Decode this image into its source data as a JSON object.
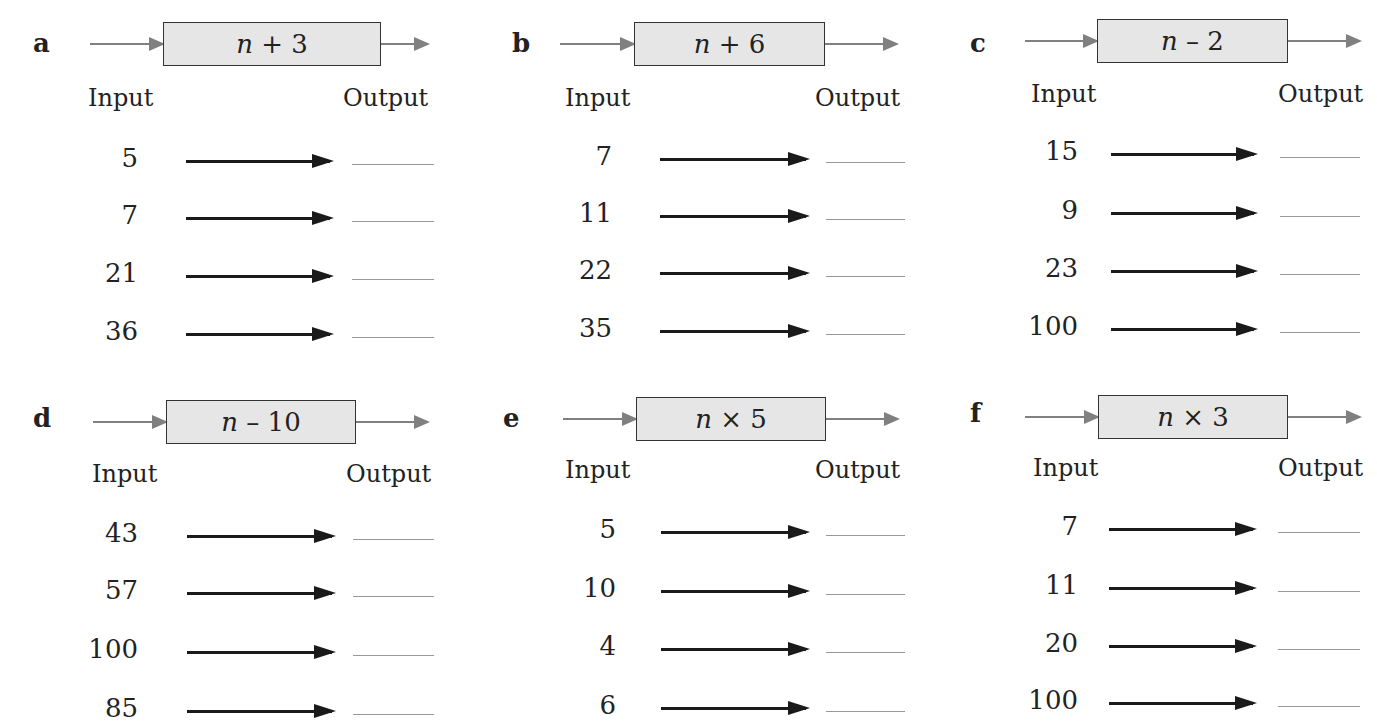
{
  "labels": {
    "input": "Input",
    "output": "Output"
  },
  "colors": {
    "machine_fill": "#e6e6e6",
    "flow_arrow": "#808080",
    "row_arrow": "#1a1a1a",
    "answer_line": "#999999"
  },
  "machines": [
    {
      "letter": "a",
      "var": "n",
      "rule": " + 3",
      "inputs": [
        "5",
        "7",
        "21",
        "36"
      ],
      "outputs": [
        "",
        "",
        "",
        ""
      ]
    },
    {
      "letter": "b",
      "var": "n",
      "rule": " + 6",
      "inputs": [
        "7",
        "11",
        "22",
        "35"
      ],
      "outputs": [
        "",
        "",
        "",
        ""
      ]
    },
    {
      "letter": "c",
      "var": "n",
      "rule": " – 2",
      "inputs": [
        "15",
        "9",
        "23",
        "100"
      ],
      "outputs": [
        "",
        "",
        "",
        ""
      ]
    },
    {
      "letter": "d",
      "var": "n",
      "rule": " – 10",
      "inputs": [
        "43",
        "57",
        "100",
        "85"
      ],
      "outputs": [
        "",
        "",
        "",
        ""
      ]
    },
    {
      "letter": "e",
      "var": "n",
      "rule": " × 5",
      "inputs": [
        "5",
        "10",
        "4",
        "6"
      ],
      "outputs": [
        "",
        "",
        "",
        ""
      ]
    },
    {
      "letter": "f",
      "var": "n",
      "rule": " × 3",
      "inputs": [
        "7",
        "11",
        "20",
        "100"
      ],
      "outputs": [
        "",
        "",
        "",
        ""
      ]
    }
  ]
}
